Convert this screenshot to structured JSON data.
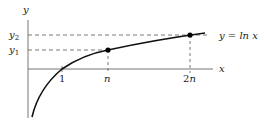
{
  "diagram": {
    "axes": {
      "x_label": "x",
      "y_label": "y"
    },
    "curve": {
      "label": "y = ln x",
      "function": "ln x"
    },
    "x_ticks": [
      {
        "label": "1",
        "italic": false
      },
      {
        "label": "n",
        "italic": true
      },
      {
        "label": "2n",
        "italic_part": "n",
        "prefix": "2"
      }
    ],
    "y_ticks": [
      {
        "label": "y",
        "subscript": "2"
      },
      {
        "label": "y",
        "subscript": "1"
      }
    ],
    "points": [
      {
        "name": "point-n",
        "x_label": "n",
        "y_label": "y1"
      },
      {
        "name": "point-2n",
        "x_label": "2n",
        "y_label": "y2"
      }
    ],
    "colors": {
      "curve": "#111111",
      "axis": "#555555",
      "dashed": "#444444",
      "point": "#000000"
    }
  }
}
